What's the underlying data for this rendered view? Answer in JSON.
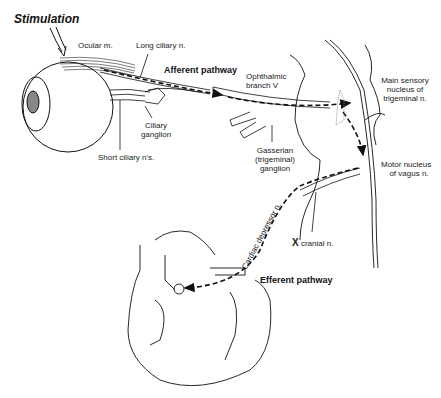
{
  "diagram": {
    "title": "Stimulation",
    "pathways": {
      "afferent": "Afferent pathway",
      "efferent": "Efferent pathway"
    },
    "labels": {
      "ocular_muscle": "Ocular m.",
      "long_ciliary": "Long ciliary n.",
      "ophthalmic_line1": "Ophthalmic",
      "ophthalmic_line2": "branch V",
      "main_sensory_line1": "Main sensory",
      "main_sensory_line2": "nucleus of",
      "main_sensory_line3": "trigeminal n.",
      "ciliary_ganglion_line1": "Ciliary",
      "ciliary_ganglion_line2": "ganglion",
      "short_ciliary": "Short ciliary n's.",
      "gasserian_line1": "Gasserian",
      "gasserian_line2": "(trigeminal)",
      "gasserian_line3": "ganglion",
      "motor_nucleus_line1": "Motor nucleus",
      "motor_nucleus_line2": "of vagus n.",
      "x_cranial_prefix": "X",
      "x_cranial_suffix": "cranial n.",
      "cardiac_depressor": "Cardiac depressor n."
    },
    "structures": [
      "eye",
      "ocular muscle",
      "ciliary ganglion",
      "ophthalmic nerve",
      "gasserian ganglion",
      "brainstem",
      "vagus nerve",
      "heart"
    ],
    "colors": {
      "line": "#1a1a1a",
      "background": "#ffffff"
    }
  }
}
